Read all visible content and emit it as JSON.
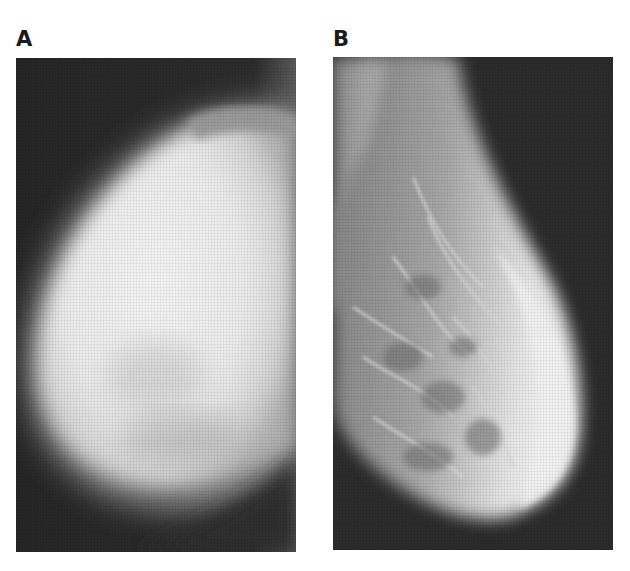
{
  "figure": {
    "panels": [
      {
        "label": "A",
        "description": "mammogram, dense breast tissue (mostly radiopaque white)"
      },
      {
        "label": "B",
        "description": "mammogram, fatty/fibroglandular breast with visible trabecular pattern"
      }
    ],
    "colors": {
      "background": "#ffffff",
      "film_dark": "#2a2a2a",
      "tissue_bright": "#f2f2f2",
      "label": "#1a1a1a"
    }
  }
}
